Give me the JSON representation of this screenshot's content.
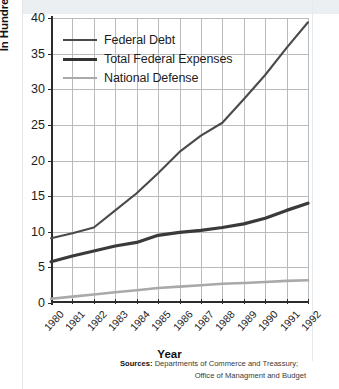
{
  "chart_data": {
    "type": "line",
    "title": "",
    "xlabel": "Year",
    "ylabel": "In Hundreds of Billions of Dollars",
    "xlim": [
      1980,
      1992
    ],
    "ylim": [
      0,
      40
    ],
    "ygrid": true,
    "xgrid": true,
    "legend_position": "top-left",
    "categories": [
      "1980",
      "1981",
      "1982",
      "1983",
      "1984",
      "1985",
      "1986",
      "1987",
      "1988",
      "1989",
      "1990",
      "1991",
      "1992"
    ],
    "x": [
      1980,
      1981,
      1982,
      1983,
      1984,
      1985,
      1986,
      1987,
      1988,
      1989,
      1990,
      1991,
      1992
    ],
    "yticks": [
      0,
      5,
      10,
      15,
      20,
      25,
      30,
      35,
      40
    ],
    "series": [
      {
        "name": "Federal Debt",
        "color": "#4a4a4a",
        "width": 2.1,
        "values": [
          9.1,
          9.8,
          10.6,
          13.0,
          15.4,
          18.2,
          21.2,
          23.5,
          25.3,
          28.6,
          32.0,
          35.8,
          39.4
        ]
      },
      {
        "name": "Total Federal Expenses",
        "color": "#3a3a3a",
        "width": 3.2,
        "values": [
          5.8,
          6.6,
          7.3,
          8.0,
          8.5,
          9.5,
          9.9,
          10.2,
          10.6,
          11.1,
          11.9,
          13.0,
          14.0
        ]
      },
      {
        "name": "National Defense",
        "color": "#a9a9a9",
        "width": 2.6,
        "values": [
          0.6,
          0.9,
          1.2,
          1.5,
          1.8,
          2.1,
          2.3,
          2.5,
          2.7,
          2.8,
          2.95,
          3.1,
          3.2
        ]
      }
    ]
  },
  "legend": {
    "items": [
      {
        "label": "Federal Debt",
        "color": "#4a4a4a",
        "thickness": "2px"
      },
      {
        "label": "Total Federal Expenses",
        "color": "#333333",
        "thickness": "3px"
      },
      {
        "label": "National Defense",
        "color": "#a9a9a9",
        "thickness": "2px"
      }
    ]
  },
  "axes": {
    "y_title": "In Hundreds of Billions of Dollars",
    "x_title": "Year"
  },
  "sources": {
    "label": "Sources:",
    "line1": "Departments of Commerce and Treassury;",
    "line2": "Office of Managment and Budget"
  }
}
